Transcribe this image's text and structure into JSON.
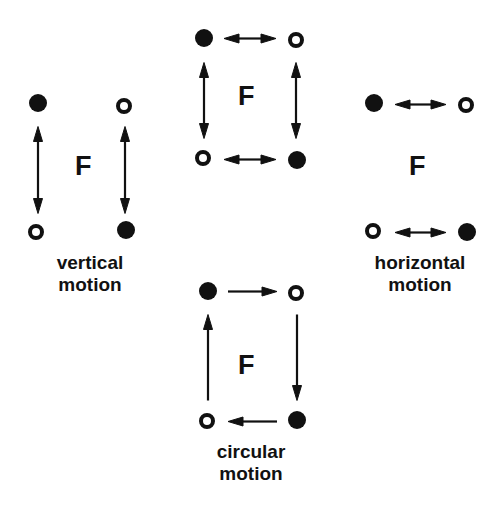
{
  "figure": {
    "width": 496,
    "height": 509,
    "background": "#ffffff",
    "ink_color": "#111111",
    "force_label": "F",
    "marker_legend": {
      "filled": "filled-circle-marker",
      "open": "open-circle-marker"
    }
  },
  "panels": [
    {
      "id": "vertical-motion",
      "caption": "vertical\nmotion",
      "caption_x": 38,
      "caption_y": 252,
      "caption_width": 104,
      "force_label": "F",
      "force_x": 75,
      "force_y": 153,
      "markers": [
        {
          "type": "filled",
          "cx": 38,
          "cy": 103
        },
        {
          "type": "open",
          "cx": 124,
          "cy": 106
        },
        {
          "type": "open",
          "cx": 36,
          "cy": 232
        },
        {
          "type": "filled",
          "cx": 126,
          "cy": 230
        }
      ],
      "arrows": [
        {
          "name": "arrow-left-vertical",
          "x1": 38,
          "y1": 126,
          "x2": 38,
          "y2": 213,
          "heads": "both"
        },
        {
          "name": "arrow-right-vertical",
          "x1": 125,
          "y1": 126,
          "x2": 125,
          "y2": 213,
          "heads": "both"
        }
      ]
    },
    {
      "id": "two-dimensional-motion",
      "caption": "",
      "force_label": "F",
      "force_x": 238,
      "force_y": 83,
      "markers": [
        {
          "type": "filled",
          "cx": 204,
          "cy": 38
        },
        {
          "type": "open",
          "cx": 296,
          "cy": 40
        },
        {
          "type": "open",
          "cx": 203,
          "cy": 158
        },
        {
          "type": "filled",
          "cx": 297,
          "cy": 160
        }
      ],
      "arrows": [
        {
          "name": "arrow-top-horizontal",
          "x1": 224,
          "y1": 38,
          "x2": 276,
          "y2": 38,
          "heads": "both"
        },
        {
          "name": "arrow-bottom-horizontal",
          "x1": 224,
          "y1": 159,
          "x2": 276,
          "y2": 159,
          "heads": "both"
        },
        {
          "name": "arrow-left-vertical",
          "x1": 204,
          "y1": 62,
          "x2": 204,
          "y2": 138,
          "heads": "both"
        },
        {
          "name": "arrow-right-vertical",
          "x1": 296,
          "y1": 62,
          "x2": 296,
          "y2": 138,
          "heads": "both"
        }
      ]
    },
    {
      "id": "horizontal-motion",
      "caption": "horizontal\nmotion",
      "caption_x": 356,
      "caption_y": 252,
      "caption_width": 128,
      "force_label": "F",
      "force_x": 409,
      "force_y": 153,
      "markers": [
        {
          "type": "filled",
          "cx": 374,
          "cy": 103
        },
        {
          "type": "open",
          "cx": 466,
          "cy": 105
        },
        {
          "type": "open",
          "cx": 373,
          "cy": 231
        },
        {
          "type": "filled",
          "cx": 467,
          "cy": 232
        }
      ],
      "arrows": [
        {
          "name": "arrow-top-horizontal",
          "x1": 395,
          "y1": 104,
          "x2": 446,
          "y2": 104,
          "heads": "both"
        },
        {
          "name": "arrow-bottom-horizontal",
          "x1": 395,
          "y1": 232,
          "x2": 446,
          "y2": 232,
          "heads": "both"
        }
      ]
    },
    {
      "id": "circular-motion",
      "caption": "circular\nmotion",
      "caption_x": 196,
      "caption_y": 441,
      "caption_width": 110,
      "force_label": "F",
      "force_x": 238,
      "force_y": 352,
      "markers": [
        {
          "type": "filled",
          "cx": 208,
          "cy": 291
        },
        {
          "type": "open",
          "cx": 296,
          "cy": 293
        },
        {
          "type": "open",
          "cx": 207,
          "cy": 421
        },
        {
          "type": "filled",
          "cx": 297,
          "cy": 420
        }
      ],
      "arrows": [
        {
          "name": "arrow-top-rightward",
          "x1": 228,
          "y1": 291,
          "x2": 277,
          "y2": 291,
          "heads": "end"
        },
        {
          "name": "arrow-right-downward",
          "x1": 297,
          "y1": 314,
          "x2": 297,
          "y2": 400,
          "heads": "end"
        },
        {
          "name": "arrow-bottom-leftward",
          "x1": 277,
          "y1": 421,
          "x2": 228,
          "y2": 421,
          "heads": "end"
        },
        {
          "name": "arrow-left-upward",
          "x1": 208,
          "y1": 400,
          "x2": 208,
          "y2": 314,
          "heads": "end"
        }
      ]
    }
  ]
}
